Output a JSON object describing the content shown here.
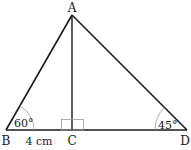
{
  "diagram": {
    "type": "geometry-triangle",
    "points": {
      "A": {
        "label": "A",
        "x": 72,
        "y": 15
      },
      "B": {
        "label": "B",
        "x": 6,
        "y": 130
      },
      "C": {
        "label": "C",
        "x": 72,
        "y": 130
      },
      "D": {
        "label": "D",
        "x": 187,
        "y": 130
      }
    },
    "segments": [
      "AB",
      "AD",
      "BD",
      "AC"
    ],
    "angles": {
      "B": {
        "label": "60°"
      },
      "D": {
        "label": "45°"
      },
      "C": {
        "label": "right-angle"
      }
    },
    "measurements": {
      "BC": {
        "label": "4 cm"
      }
    },
    "colors": {
      "stroke": "#1a1a1a",
      "arc": "#9a9a9a",
      "background": "#ffffff"
    }
  }
}
